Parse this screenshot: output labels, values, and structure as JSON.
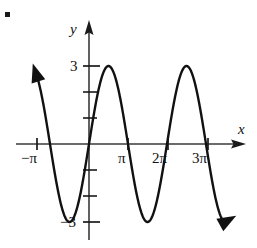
{
  "figure": {
    "marker": "square-bullet",
    "axis_color": "#333333",
    "curve_color": "#111111"
  },
  "axes": {
    "x_label": "x",
    "y_label": "y",
    "x_ticks": [
      {
        "label": "−π",
        "value": -3.14159
      },
      {
        "label": "π",
        "value": 3.14159
      },
      {
        "label": "2π",
        "value": 6.28319
      },
      {
        "label": "3π",
        "value": 9.42478
      }
    ],
    "y_ticks": [
      {
        "label": "3",
        "value": 3
      },
      {
        "label": "−3",
        "value": -3
      }
    ],
    "y_unlabeled_ticks": [
      1,
      2,
      -1,
      -2
    ]
  },
  "chart_data": {
    "type": "line",
    "title": "",
    "xlabel": "x",
    "ylabel": "y",
    "function": "y = 3 sin(x)",
    "amplitude": 3,
    "period": 6.28319,
    "xlim": [
      -4.3,
      11.2
    ],
    "ylim": [
      -4.6,
      4.2
    ],
    "grid": false,
    "legend": null,
    "x_tick_labels": [
      "−π",
      "π",
      "2π",
      "3π"
    ],
    "x_tick_values": [
      -3.14159,
      3.14159,
      6.28319,
      9.42478
    ],
    "y_tick_labels": [
      "3",
      "−3"
    ],
    "y_tick_values": [
      3,
      -3
    ],
    "zeros": [
      -3.14159,
      0,
      3.14159,
      6.28319,
      9.42478
    ],
    "maxima": [
      {
        "x": 1.5708,
        "y": 3
      },
      {
        "x": 7.85398,
        "y": 3
      }
    ],
    "minima": [
      {
        "x": -1.5708,
        "y": -3
      },
      {
        "x": 4.71239,
        "y": -3
      },
      {
        "x": 10.9956,
        "y": -3
      }
    ],
    "arrow_ends": [
      "upper-left",
      "lower-right"
    ],
    "x": [
      -4.3,
      -4.1,
      -3.9,
      -3.7,
      -3.5,
      -3.3,
      -3.14159,
      -2.9,
      -2.7,
      -2.5,
      -2.3,
      -2.1,
      -1.9,
      -1.5708,
      -1.3,
      -1.1,
      -0.9,
      -0.7,
      -0.5,
      -0.3,
      0,
      0.3,
      0.5,
      0.7,
      0.9,
      1.1,
      1.3,
      1.5708,
      1.9,
      2.1,
      2.3,
      2.5,
      2.7,
      2.9,
      3.14159,
      3.4,
      3.7,
      3.9,
      4.1,
      4.3,
      4.71239,
      5.1,
      5.3,
      5.5,
      5.7,
      5.9,
      6.28319,
      6.6,
      6.9,
      7.2,
      7.5,
      7.85398,
      8.2,
      8.5,
      8.8,
      9.1,
      9.42478,
      9.8,
      10.2,
      10.6,
      10.9956,
      11.2
    ],
    "y": [
      2.64,
      2.46,
      2.07,
      1.53,
      0.92,
      0.28,
      0,
      -0.73,
      -1.29,
      -1.8,
      -2.24,
      -2.59,
      -2.84,
      -3,
      -2.89,
      -2.67,
      -2.35,
      -1.93,
      -1.44,
      -0.89,
      0,
      0.89,
      1.44,
      1.93,
      2.35,
      2.67,
      2.89,
      3,
      2.84,
      2.59,
      2.24,
      1.8,
      1.29,
      0.73,
      0,
      -0.77,
      -1.63,
      -2.1,
      -2.48,
      -2.77,
      -3,
      -2.74,
      -2.49,
      -2.12,
      -1.68,
      -1.17,
      0,
      0.95,
      1.77,
      2.42,
      2.82,
      3,
      2.84,
      2.52,
      2.03,
      1.37,
      0,
      -1.0,
      -2.1,
      -2.8,
      -3,
      -2.92
    ]
  }
}
